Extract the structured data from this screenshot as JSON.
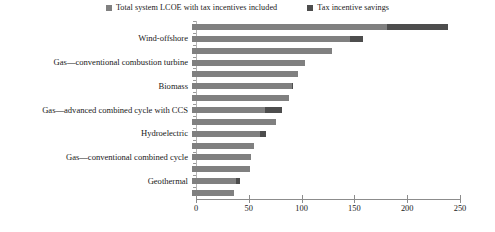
{
  "legend": {
    "entries": [
      {
        "label": "Total system LCOE with tax incentives included",
        "color": "#808080",
        "icon": "square-swatch"
      },
      {
        "label": "Tax incentive savings",
        "color": "#4d4d4d",
        "icon": "square-swatch"
      }
    ]
  },
  "axis": {
    "ticks": [
      "0",
      "50",
      "100",
      "150",
      "200",
      "250"
    ]
  },
  "chart_data": {
    "type": "bar",
    "orientation": "horizontal",
    "stacked": true,
    "title": "",
    "xlabel": "",
    "ylabel": "",
    "xlim": [
      0,
      250
    ],
    "grid": false,
    "legend_position": "top-center",
    "categories": [
      "",
      "Wind-offshore",
      "",
      "Gas—conventional combustion turbine",
      "",
      "Biomass",
      "",
      "Gas—advanced combined cycle with CCS",
      "",
      "Hydroelectric",
      "",
      "Gas—conventional combined cycle",
      "",
      "Geothermal",
      ""
    ],
    "series": [
      {
        "name": "Total system LCOE with tax incentives included",
        "color": "#808080",
        "values": [
          185,
          150,
          133,
          107,
          100,
          95,
          92,
          69,
          80,
          64,
          59,
          56,
          55,
          42,
          40
        ]
      },
      {
        "name": "Tax incentive savings",
        "color": "#4d4d4d",
        "values": [
          57,
          12,
          0,
          0,
          0,
          1,
          0,
          16,
          0,
          6,
          0,
          0,
          0,
          3,
          0
        ]
      }
    ],
    "totals": [
      242,
      162,
      133,
      107,
      100,
      96,
      92,
      85,
      80,
      70,
      59,
      56,
      55,
      45,
      40
    ]
  }
}
